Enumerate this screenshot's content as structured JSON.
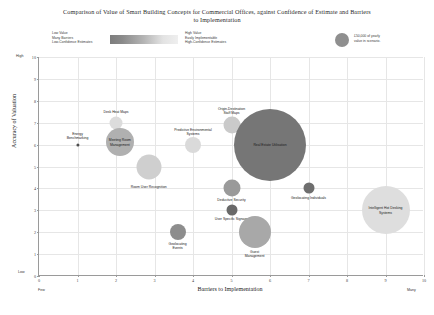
{
  "chart_data": {
    "type": "scatter",
    "title": "Comparison of Value of Smart Building Concepts for Commercial Offices, against Confidence of Estimate and Barriers to Implementation",
    "xlabel": "Barriers to Implementation",
    "ylabel": "Accuracy of Valuation",
    "xlim": [
      0,
      10
    ],
    "ylim": [
      0,
      10
    ],
    "xticks": [
      "0",
      "1",
      "2",
      "3",
      "4",
      "5",
      "6",
      "7",
      "8",
      "9",
      "10"
    ],
    "yticks": [
      "0",
      "1",
      "2",
      "3",
      "4",
      "5",
      "6",
      "7",
      "8",
      "9",
      "10"
    ],
    "x_axis_low_label": "Few",
    "x_axis_high_label": "Many",
    "y_axis_low_label": "Low",
    "y_axis_high_label": "High",
    "grid": true,
    "legend_position": "top",
    "colorbar": {
      "low_lines": [
        "Low Value",
        "Many Barriers",
        "Low-Confidence Estimates"
      ],
      "high_lines": [
        "High Value",
        "Easily Implementable",
        "High-Confidence Estimates"
      ],
      "low_color": "#7d7d7d",
      "high_color": "#efefef"
    },
    "size_legend": {
      "label_lines": [
        "£50,000 of yearly",
        "value in scenario."
      ],
      "radius_px": 7,
      "color": "#8f8f8f"
    },
    "points": [
      {
        "label": "Energy Benchmarking",
        "x": 1.0,
        "y": 6.0,
        "r": 1.6,
        "color": "#4e4e4e",
        "label_dx": 0,
        "label_dy": -9,
        "label_text": "Energy\nBenchmarking"
      },
      {
        "label": "Desk Heat Maps",
        "x": 2.0,
        "y": 7.0,
        "r": 6.5,
        "color": "#dcdcdc",
        "label_dx": 0,
        "label_dy": -11,
        "label_text": "Desk Heat Maps"
      },
      {
        "label": "Meeting Room Management",
        "x": 2.1,
        "y": 6.1,
        "r": 14.0,
        "color": "#b0b0b0",
        "label_dx": 0,
        "label_dy": 0,
        "label_text": "Meeting Room\nManagement"
      },
      {
        "label": "Room User Recognition",
        "x": 2.85,
        "y": 5.0,
        "r": 12.5,
        "color": "#cfcfcf",
        "label_dx": 0,
        "label_dy": 20,
        "label_text": "Room User Recognition"
      },
      {
        "label": "Predictive Environmental Systems",
        "x": 4.0,
        "y": 6.0,
        "r": 8.0,
        "color": "#dadada",
        "label_dx": 0,
        "label_dy": -13,
        "label_text": "Predictive Environmental\nSystems"
      },
      {
        "label": "Origin-Destination Staff Maps",
        "x": 5.0,
        "y": 6.9,
        "r": 8.5,
        "color": "#cacaca",
        "label_dx": 0,
        "label_dy": -14,
        "label_text": "Origin-Destination\nStaff Maps"
      },
      {
        "label": "Real Estate Utilisation",
        "x": 6.0,
        "y": 6.0,
        "r": 36.0,
        "color": "#767676",
        "label_dx": 0,
        "label_dy": 0,
        "label_text": "Real Estate Utilisation"
      },
      {
        "label": "Deductive Security",
        "x": 5.0,
        "y": 4.0,
        "r": 8.5,
        "color": "#9a9a9a",
        "label_dx": 0,
        "label_dy": 12,
        "label_text": "Deductive Security"
      },
      {
        "label": "User Specific Signage",
        "x": 5.0,
        "y": 3.0,
        "r": 5.5,
        "color": "#696969",
        "label_dx": 0,
        "label_dy": 9,
        "label_text": "User Specific Signage"
      },
      {
        "label": "Geolocating Individuals",
        "x": 7.0,
        "y": 4.0,
        "r": 5.5,
        "color": "#6e6e6e",
        "label_dx": 0,
        "label_dy": 10,
        "label_text": "Geolocating Individuals"
      },
      {
        "label": "Intelligent Hot Desking Systems",
        "x": 9.0,
        "y": 3.0,
        "r": 24.0,
        "color": "#dedede",
        "label_dx": 0,
        "label_dy": 0,
        "label_text": "Intelligent Hot Desking\nSystems"
      },
      {
        "label": "Geolocating Events",
        "x": 3.6,
        "y": 2.0,
        "r": 8.0,
        "color": "#8d8d8d",
        "label_dx": 0,
        "label_dy": 14,
        "label_text": "Geolocating\nEvents"
      },
      {
        "label": "Guest Management",
        "x": 5.6,
        "y": 2.0,
        "r": 16.0,
        "color": "#a8a8a8",
        "label_dx": 0,
        "label_dy": 22,
        "label_text": "Guest\nManagement"
      }
    ]
  }
}
